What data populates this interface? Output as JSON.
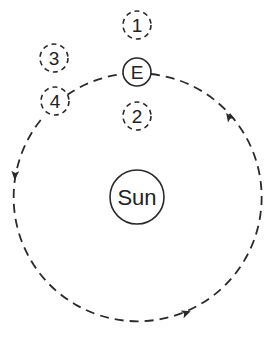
{
  "diagram": {
    "type": "orbit",
    "stroke_color": "#2a2a2a",
    "background": "#ffffff",
    "sun": {
      "label": "Sun",
      "cx": 137,
      "cy": 197,
      "r": 27
    },
    "orbit": {
      "cx": 137,
      "cy": 198,
      "r": 124,
      "style": "dashed",
      "direction": "counterclockwise"
    },
    "earth": {
      "label": "E",
      "cx": 137,
      "cy": 72,
      "r": 14
    },
    "positions": [
      {
        "label": "1",
        "cx": 137,
        "cy": 25,
        "r": 14
      },
      {
        "label": "2",
        "cx": 137,
        "cy": 116,
        "r": 14
      },
      {
        "label": "3",
        "cx": 54,
        "cy": 58,
        "r": 14
      },
      {
        "label": "4",
        "cx": 55,
        "cy": 101,
        "r": 14
      }
    ],
    "arrows": [
      {
        "x": 229,
        "y": 117,
        "angle": -125
      },
      {
        "x": 15,
        "y": 175,
        "angle": 95
      },
      {
        "x": 186,
        "y": 313,
        "angle": -20
      }
    ]
  }
}
